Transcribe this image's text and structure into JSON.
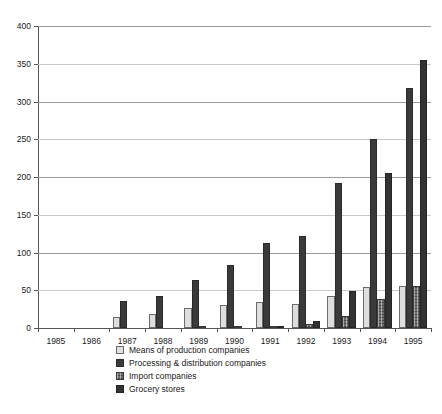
{
  "chart_data": {
    "type": "bar",
    "title": "",
    "xlabel": "",
    "ylabel": "",
    "grid": true,
    "legend_position": "bottom",
    "ylim": [
      0,
      400
    ],
    "yticks": [
      0,
      50,
      100,
      150,
      200,
      250,
      300,
      350,
      400
    ],
    "categories": [
      "1985",
      "1986",
      "1987",
      "1988",
      "1989",
      "1990",
      "1991",
      "1992",
      "1993",
      "1994",
      "1995"
    ],
    "series": [
      {
        "name": "Means of production companies",
        "color": "#dedede",
        "values": [
          0,
          0,
          15,
          18,
          26,
          30,
          35,
          32,
          43,
          54,
          56
        ]
      },
      {
        "name": "Processing & distribution companies",
        "color": "#3a3a3a",
        "values": [
          0,
          0,
          36,
          42,
          63,
          83,
          113,
          122,
          192,
          251,
          318
        ]
      },
      {
        "name": "Import companies",
        "color": "#6e6e6e",
        "values": [
          0,
          0,
          0,
          0,
          2,
          2,
          2,
          5,
          16,
          39,
          56
        ]
      },
      {
        "name": "Grocery stores",
        "color": "#333333",
        "values": [
          0,
          0,
          0,
          0,
          0,
          0,
          1,
          9,
          49,
          205,
          355
        ]
      }
    ]
  }
}
